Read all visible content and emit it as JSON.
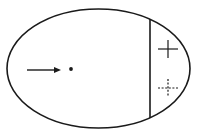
{
  "diagram": {
    "background": "#ffffff",
    "stroke_color": "#1a1a1a",
    "ellipse": {
      "cx": 98.5,
      "cy": 68.5,
      "rx": 91.5,
      "ry": 59.5,
      "stroke_width": 1.6
    },
    "divider": {
      "x": 150,
      "y1": 19,
      "y2": 118,
      "stroke_width": 1.6
    },
    "arrow": {
      "x1": 27,
      "y1": 70,
      "x2": 61,
      "y2": 70,
      "stroke_width": 1.4
    },
    "dot": {
      "cx": 71,
      "cy": 69,
      "r": 1.9
    },
    "solid_plus": {
      "cx": 168,
      "cy": 49,
      "half_w": 10,
      "half_h": 9,
      "stroke_width": 1.2
    },
    "dashed_plus": {
      "cx": 168,
      "cy": 88,
      "half_w": 10,
      "half_h": 9,
      "stroke_width": 1.2,
      "dash": "2,1.6"
    }
  }
}
